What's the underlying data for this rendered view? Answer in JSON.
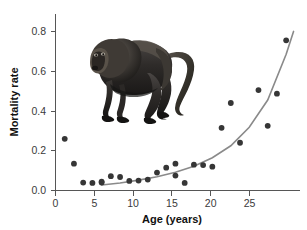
{
  "figure": {
    "background_color": "#ffffff",
    "point_color": "#363636",
    "curve_color": "#8a8a8a",
    "axis_color": "#565656",
    "photo_caption": "baboon-photograph"
  },
  "chart_data": {
    "type": "scatter",
    "title": "",
    "xlabel": "Age (years)",
    "ylabel": "Mortality rate",
    "xlim": [
      0,
      26.5
    ],
    "ylim": [
      0.0,
      0.88
    ],
    "grid": false,
    "legend": null,
    "xticks": [
      0,
      5,
      10,
      15,
      20,
      25
    ],
    "xtick_labels": [
      "0",
      "5",
      "10",
      "15",
      "20",
      "25"
    ],
    "yticks": [
      0.0,
      0.2,
      0.4,
      0.6,
      0.8
    ],
    "ytick_labels": [
      "0.0",
      "0.2",
      "0.4",
      "0.6",
      "0.8"
    ],
    "series": [
      {
        "name": "observed-mortality",
        "marker": "circle",
        "color": "#363636",
        "x": [
          1,
          2,
          3,
          4,
          5,
          5,
          6,
          7,
          8,
          9,
          10,
          11,
          12,
          13,
          13,
          14,
          15,
          16,
          17,
          18,
          19,
          20,
          22,
          23,
          24,
          25
        ],
        "y": [
          0.26,
          0.135,
          0.04,
          0.038,
          0.04,
          0.045,
          0.072,
          0.068,
          0.048,
          0.05,
          0.055,
          0.09,
          0.115,
          0.135,
          0.075,
          0.038,
          0.13,
          0.128,
          0.12,
          0.315,
          0.44,
          0.24,
          0.505,
          0.325,
          0.487,
          0.755
        ]
      },
      {
        "name": "fitted-gompertz-curve",
        "marker": "line",
        "color": "#8a8a8a",
        "x": [
          5.0,
          7.0,
          9.0,
          11.0,
          13.0,
          15.0,
          17.0,
          19.0,
          21.0,
          23.0,
          25.0,
          25.8
        ],
        "y": [
          0.028,
          0.038,
          0.052,
          0.069,
          0.092,
          0.122,
          0.165,
          0.225,
          0.318,
          0.455,
          0.685,
          0.8
        ]
      }
    ]
  },
  "annotations": {
    "photo_subject": "baboon"
  }
}
